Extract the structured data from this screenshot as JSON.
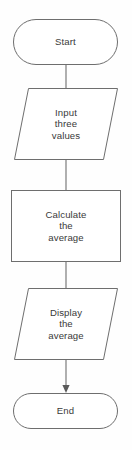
{
  "diagram": {
    "type": "flowchart",
    "orientation": "vertical",
    "colors": {
      "background": "#fefefe",
      "shape_fill": "#ffffff",
      "shape_stroke": "#6e6e6e",
      "text": "#3a3a3a",
      "arrow": "#5a5a5a"
    },
    "nodes": [
      {
        "id": "start",
        "shape": "terminator",
        "shape_name": "stadium",
        "lines": [
          "Start"
        ]
      },
      {
        "id": "input",
        "shape": "input-output",
        "shape_name": "parallelogram",
        "lines": [
          "Input",
          "three",
          "values"
        ]
      },
      {
        "id": "process",
        "shape": "process",
        "shape_name": "rectangle",
        "lines": [
          "Calculate",
          "the",
          "average"
        ]
      },
      {
        "id": "display",
        "shape": "input-output",
        "shape_name": "parallelogram",
        "lines": [
          "Display",
          "the",
          "average"
        ]
      },
      {
        "id": "end",
        "shape": "terminator",
        "shape_name": "stadium",
        "lines": [
          "End"
        ]
      }
    ],
    "connectors": [
      {
        "id": "start-to-input",
        "from": "start",
        "to": "input",
        "arrowhead": false
      },
      {
        "id": "input-to-process",
        "from": "input",
        "to": "process",
        "arrowhead": false
      },
      {
        "id": "process-to-display",
        "from": "process",
        "to": "display",
        "arrowhead": false
      },
      {
        "id": "display-to-end",
        "from": "display",
        "to": "end",
        "arrowhead": true
      }
    ]
  }
}
